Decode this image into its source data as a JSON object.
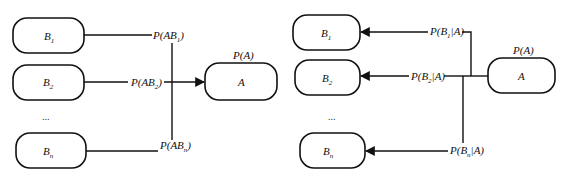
{
  "left_diagram": {
    "title": "Total probability",
    "nodes": {
      "b1": {
        "label": "B",
        "sub": "1"
      },
      "b2": {
        "label": "B",
        "sub": "2"
      },
      "ellipsis": "...",
      "bn": {
        "label": "B",
        "sub": "n"
      },
      "a": {
        "label": "A",
        "prob": "P(A)"
      }
    },
    "edges": {
      "e1": {
        "pre": "P(AB",
        "sub": "1",
        "post": ")"
      },
      "e2": {
        "pre": "P(AB",
        "sub": "2",
        "post": ")"
      },
      "en": {
        "pre": "P(AB",
        "sub": "n",
        "post": ")"
      }
    }
  },
  "right_diagram": {
    "title": "Bayes",
    "nodes": {
      "b1": {
        "label": "B",
        "sub": "1"
      },
      "b2": {
        "label": "B",
        "sub": "2"
      },
      "ellipsis": "...",
      "bn": {
        "label": "B",
        "sub": "n"
      },
      "a": {
        "label": "A",
        "prob": "P(A)"
      }
    },
    "edges": {
      "e1": {
        "pre": "P(B",
        "sub": "1",
        "post": "|A)"
      },
      "e2": {
        "pre": "P(B",
        "sub": "2",
        "post": "|A)"
      },
      "en": {
        "pre": "P(B",
        "sub": "n",
        "post": "|A)"
      }
    }
  },
  "colors": {
    "stroke": "#111111",
    "background": "#ffffff"
  }
}
